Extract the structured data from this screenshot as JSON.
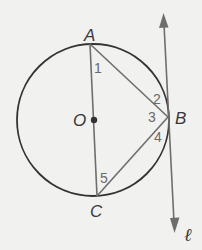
{
  "diagram": {
    "type": "circle-geometry",
    "points": {
      "A": {
        "label": "A"
      },
      "B": {
        "label": "B"
      },
      "C": {
        "label": "C"
      },
      "O": {
        "label": "O"
      }
    },
    "angles": [
      {
        "id": "1",
        "label": "1",
        "at": "A"
      },
      {
        "id": "2",
        "label": "2",
        "at": "B"
      },
      {
        "id": "3",
        "label": "3",
        "at": "B"
      },
      {
        "id": "4",
        "label": "4",
        "at": "B"
      },
      {
        "id": "5",
        "label": "5",
        "at": "C"
      }
    ],
    "tangent_line": {
      "label": "ℓ"
    },
    "colors": {
      "background": "#f1f1ef",
      "circle": "#333333",
      "segments": "#6e6e6e",
      "tangent": "#6e6e6e",
      "labels": "#3a3a3a",
      "angle_numbers": "#6a6a6a"
    }
  }
}
